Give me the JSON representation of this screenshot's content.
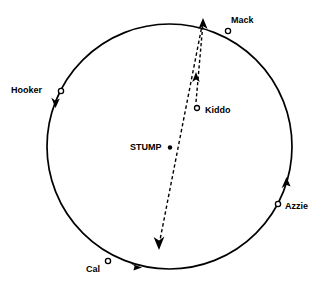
{
  "figure": {
    "type": "spatial-point-diagram",
    "background_color": "#ffffff",
    "stroke_color": "#000000",
    "width": 326,
    "height": 289
  },
  "circle": {
    "name": "boundary-circle",
    "center_x": 169.5,
    "center_y": 146.5,
    "radius": 122.5,
    "stroke_width": 1.6
  },
  "nodes": {
    "mack": {
      "label": "Mack",
      "marker": "open-circle",
      "x": 228,
      "y": 31
    },
    "hooker": {
      "label": "Hooker",
      "marker": "open-circle",
      "x": 61,
      "y": 91
    },
    "kiddo": {
      "label": "Kiddo",
      "marker": "open-circle",
      "x": 197,
      "y": 108
    },
    "stump": {
      "label": "STUMP",
      "marker": "filled-dot",
      "x": 170,
      "y": 147
    },
    "azzie": {
      "label": "Azzie",
      "marker": "open-circle",
      "x": 278,
      "y": 204
    },
    "cal": {
      "label": "Cal",
      "marker": "open-circle",
      "x": 108,
      "y": 261
    }
  },
  "dashed_paths": [
    {
      "name": "kiddo-to-rim-path",
      "from": "kiddo",
      "to": "circle-rim-top",
      "x1": 196,
      "y1": 102,
      "x2": 203,
      "y2": 23,
      "arrowhead_x": 196,
      "arrowhead_y": 76,
      "arrowhead_direction": "up",
      "terminal_arrowhead_x": 203,
      "terminal_arrowhead_y": 23,
      "terminal_arrowhead_direction": "up"
    },
    {
      "name": "rim-to-lower-left-path",
      "from": "circle-rim-top",
      "to": "interior-lower-left",
      "x1": 203,
      "y1": 23,
      "x2": 160,
      "y2": 246,
      "arrowhead_x": 160,
      "arrowhead_y": 246,
      "arrowhead_direction": "down"
    }
  ],
  "rim_arrowheads": [
    {
      "name": "hooker-rim-arrowhead",
      "x": 56,
      "y": 104,
      "direction": "clockwise-down"
    },
    {
      "name": "cal-rim-arrowhead",
      "x": 138,
      "y": 266,
      "direction": "clockwise-right"
    },
    {
      "name": "azzie-rim-arrowhead",
      "x": 286,
      "y": 181,
      "direction": "counterclockwise-up"
    }
  ],
  "labels": {
    "mack": "Mack",
    "hooker": "Hooker",
    "kiddo": "Kiddo",
    "stump": "STUMP",
    "azzie": "Azzie",
    "cal": "Cal"
  }
}
